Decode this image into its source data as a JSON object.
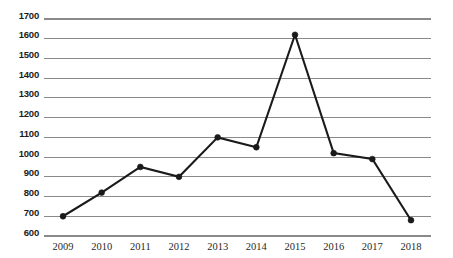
{
  "chart_data": {
    "type": "line",
    "title": "",
    "subtitle": "",
    "xlabel": "",
    "ylabel": "",
    "categories": [
      "2009",
      "2010",
      "2011",
      "2012",
      "2013",
      "2014",
      "2015",
      "2016",
      "2017",
      "2018"
    ],
    "values": [
      700,
      820,
      950,
      900,
      1100,
      1050,
      1620,
      1020,
      990,
      680
    ],
    "series": [
      {
        "name": "",
        "values": [
          700,
          820,
          950,
          900,
          1100,
          1050,
          1620,
          1020,
          990,
          680
        ]
      }
    ],
    "ylim": [
      600,
      1700
    ],
    "ytick_labels": [
      "600",
      "700",
      "800",
      "900",
      "1000",
      "1100",
      "1200",
      "1300",
      "1400",
      "1500",
      "1600",
      "1700"
    ],
    "ytick_values": [
      600,
      700,
      800,
      900,
      1000,
      1100,
      1200,
      1300,
      1400,
      1500,
      1600,
      1700
    ],
    "xtick_labels": [
      "2009",
      "2010",
      "2011",
      "2012",
      "2013",
      "2014",
      "2015",
      "2016",
      "2017",
      "2018"
    ],
    "grid": true,
    "grid_axis": "y",
    "legend": false,
    "legend_position": "none",
    "marker": "circle",
    "line_color": "#1a1a1a",
    "grid_color": "#8a8a8a",
    "background_color": "#ffffff",
    "annotations": []
  }
}
